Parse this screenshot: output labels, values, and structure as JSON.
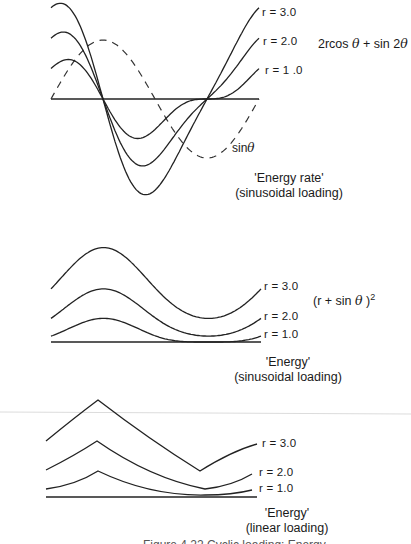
{
  "chart_data": [
    {
      "type": "line",
      "title": "'Energy rate'",
      "subtitle": "(sinusoidal loading)",
      "formula": "2rcos θ + sin 2θ",
      "x_domain": "θ from 0 to 2π",
      "grid": false,
      "series": [
        {
          "name": "r = 3.0",
          "r": 3.0,
          "expr": "2*r*cos(t)+sin(2*t)",
          "style": "solid"
        },
        {
          "name": "r = 2.0",
          "r": 2.0,
          "expr": "2*r*cos(t)+sin(2*t)",
          "style": "solid"
        },
        {
          "name": "r = 1 .0",
          "r": 1.0,
          "expr": "2*r*cos(t)+sin(2*t)",
          "style": "solid"
        },
        {
          "name": "sinθ",
          "expr": "sin(t)",
          "style": "dashed"
        }
      ],
      "zero_crossings_theta": [
        "π/2",
        "3π/2"
      ]
    },
    {
      "type": "line",
      "title": "'Energy'",
      "subtitle": "(sinusoidal loading)",
      "formula": "(r + sin θ )²",
      "x_domain": "θ from 0 to 2π",
      "grid": false,
      "series": [
        {
          "name": "r = 3.0",
          "r": 3.0,
          "expr": "(r+sin(t))^2",
          "values_at_key_points": {
            "start": 9,
            "peak": 16,
            "min": 4
          }
        },
        {
          "name": "r = 2.0",
          "r": 2.0,
          "expr": "(r+sin(t))^2",
          "values_at_key_points": {
            "start": 4,
            "peak": 9,
            "min": 1
          }
        },
        {
          "name": "r = 1.0",
          "r": 1.0,
          "expr": "(r+sin(t))^2",
          "values_at_key_points": {
            "start": 1,
            "peak": 4,
            "min": 0
          }
        }
      ]
    },
    {
      "type": "line",
      "title": "'Energy'",
      "subtitle": "(linear loading)",
      "grid": false,
      "series": [
        {
          "name": "r = 3.0",
          "points": [
            [
              0,
              3.9
            ],
            [
              0.25,
              6.9
            ],
            [
              0.74,
              1.9
            ],
            [
              1.0,
              3.7
            ]
          ]
        },
        {
          "name": "r = 2.0",
          "points": [
            [
              0,
              1.9
            ],
            [
              0.25,
              3.9
            ],
            [
              0.76,
              0.6
            ],
            [
              1.0,
              1.6
            ]
          ]
        },
        {
          "name": "r = 1.0",
          "points": [
            [
              0,
              0.6
            ],
            [
              0.25,
              1.8
            ],
            [
              0.76,
              0.1
            ],
            [
              1.0,
              0.5
            ]
          ]
        }
      ]
    }
  ],
  "labels": {
    "top": {
      "r3": "r = 3.0",
      "r2": "r = 2.0",
      "r1": "r = 1 .0",
      "sin": "sin",
      "theta": "θ",
      "formula_a": "2rcos ",
      "formula_theta": "θ",
      "formula_b": " + sin 2",
      "formula_theta2": "θ",
      "title": "'Energy rate'",
      "subtitle": "(sinusoidal loading)"
    },
    "middle": {
      "r3": "r = 3.0",
      "r2": "r = 2.0",
      "r1": "r = 1.0",
      "formula_a": "(r + sin ",
      "formula_theta": "θ",
      "formula_b": " )",
      "formula_sup": "2",
      "title": "'Energy'",
      "subtitle": "(sinusoidal loading)"
    },
    "bottom": {
      "r3": "r = 3.0",
      "r2": "r = 2.0",
      "r1": "r = 1.0",
      "title": "'Energy'",
      "subtitle": "(linear loading)"
    },
    "caption": "Figure 4.22  Cyclic loading: Energy"
  }
}
